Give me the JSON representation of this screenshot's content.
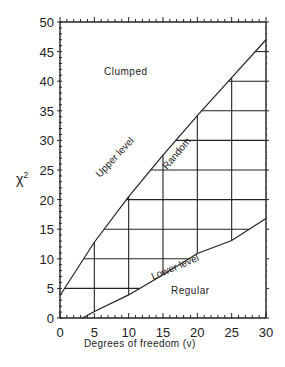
{
  "chart_data": {
    "type": "line",
    "title": "",
    "xlabel": "Degrees of freedom (ν)",
    "ylabel": "χ²",
    "xlim": [
      0,
      30
    ],
    "ylim": [
      0,
      50
    ],
    "xticks": [
      0,
      5,
      10,
      15,
      20,
      25,
      30
    ],
    "yticks": [
      0,
      5,
      10,
      15,
      20,
      25,
      30,
      35,
      40,
      45,
      50
    ],
    "series": [
      {
        "name": "Upper level",
        "x": [
          0,
          5,
          10,
          15,
          20,
          25,
          30
        ],
        "y": [
          3.8,
          12.8,
          20.5,
          27.5,
          34.2,
          40.6,
          47.0
        ]
      },
      {
        "name": "Lower level",
        "x": [
          3.3,
          5,
          10,
          15,
          20,
          25,
          30
        ],
        "y": [
          0,
          1.1,
          3.9,
          7.3,
          10.9,
          13.1,
          16.8
        ]
      }
    ],
    "grid": {
      "x": [
        5,
        10,
        15,
        20,
        25
      ],
      "y": [
        5,
        10,
        15,
        20,
        25,
        30,
        35,
        40,
        45
      ]
    },
    "annotations": [
      "Clumped",
      "Upper level",
      "Random",
      "Lower level",
      "Regular"
    ]
  },
  "labels": {
    "clumped": "Clumped",
    "random": "Random",
    "regular": "Regular",
    "upper": "Upper level",
    "lower": "Lower level",
    "xlabel": "Degrees of freedom (ν)",
    "ylabel": "χ",
    "ysup": "2"
  }
}
